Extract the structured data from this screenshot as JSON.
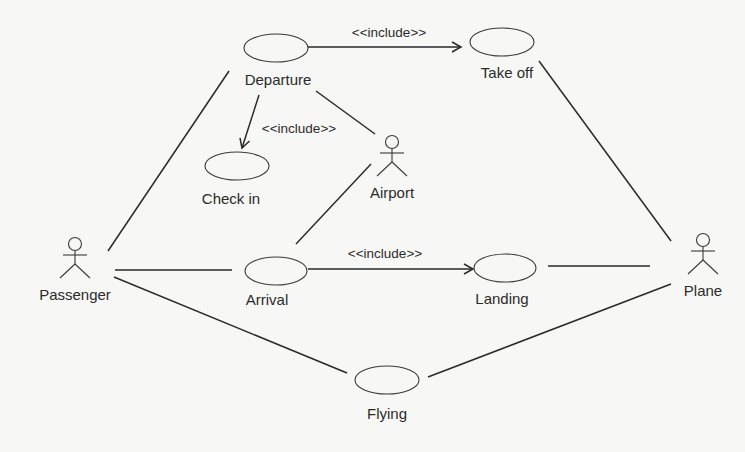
{
  "diagram": {
    "type": "uml-use-case",
    "actors": [
      {
        "id": "passenger",
        "label": "Passenger",
        "x": 75,
        "y": 244
      },
      {
        "id": "airport",
        "label": "Airport",
        "x": 392,
        "y": 142
      },
      {
        "id": "plane",
        "label": "Plane",
        "x": 703,
        "y": 240
      }
    ],
    "use_cases": [
      {
        "id": "departure",
        "label": "Departure",
        "cx": 276,
        "cy": 48,
        "rx": 32,
        "ry": 14,
        "lx": 278,
        "ly": 85
      },
      {
        "id": "take_off",
        "label": "Take off",
        "cx": 502,
        "cy": 42,
        "rx": 32,
        "ry": 14,
        "lx": 507,
        "ly": 78
      },
      {
        "id": "check_in",
        "label": "Check in",
        "cx": 237,
        "cy": 166,
        "rx": 32,
        "ry": 14,
        "lx": 231,
        "ly": 204
      },
      {
        "id": "arrival",
        "label": "Arrival",
        "cx": 276,
        "cy": 271,
        "rx": 31,
        "ry": 14,
        "lx": 267,
        "ly": 305
      },
      {
        "id": "landing",
        "label": "Landing",
        "cx": 505,
        "cy": 268,
        "rx": 31,
        "ry": 14,
        "lx": 502,
        "ly": 304
      },
      {
        "id": "flying",
        "label": "Flying",
        "cx": 387,
        "cy": 380,
        "rx": 32,
        "ry": 14,
        "lx": 387,
        "ly": 419
      }
    ],
    "associations": [
      {
        "from": "passenger",
        "to": "departure",
        "x1": 108,
        "y1": 251,
        "x2": 229,
        "y2": 71
      },
      {
        "from": "passenger",
        "to": "arrival",
        "x1": 115,
        "y1": 270,
        "x2": 232,
        "y2": 270
      },
      {
        "from": "passenger",
        "to": "flying",
        "x1": 114,
        "y1": 277,
        "x2": 347,
        "y2": 373
      },
      {
        "from": "departure",
        "to": "airport",
        "x1": 316,
        "y1": 91,
        "x2": 375,
        "y2": 134
      },
      {
        "from": "arrival",
        "to": "airport",
        "x1": 296,
        "y1": 244,
        "x2": 371,
        "y2": 164
      },
      {
        "from": "take_off",
        "to": "plane",
        "x1": 539,
        "y1": 61,
        "x2": 671,
        "y2": 241
      },
      {
        "from": "landing",
        "to": "plane",
        "x1": 548,
        "y1": 266,
        "x2": 650,
        "y2": 266
      },
      {
        "from": "flying",
        "to": "plane",
        "x1": 428,
        "y1": 377,
        "x2": 671,
        "y2": 284
      }
    ],
    "includes": [
      {
        "from": "departure",
        "to": "take_off",
        "label": "<<include>>",
        "x1": 308,
        "y1": 47,
        "x2": 461,
        "y2": 47,
        "lx": 389,
        "ly": 37
      },
      {
        "from": "departure",
        "to": "check_in",
        "label": "<<include>>",
        "x1": 259,
        "y1": 95,
        "x2": 242,
        "y2": 148,
        "lx": 299,
        "ly": 133
      },
      {
        "from": "arrival",
        "to": "landing",
        "label": "<<include>>",
        "x1": 308,
        "y1": 269,
        "x2": 473,
        "y2": 269,
        "lx": 385,
        "ly": 258
      }
    ]
  }
}
